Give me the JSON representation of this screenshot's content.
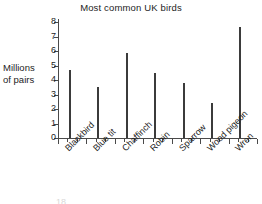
{
  "chart_data": {
    "type": "bar",
    "title": "Most common UK birds",
    "xlabel": "",
    "ylabel": "Millions of pairs",
    "ylabel_lines": [
      "Millions",
      "of pairs"
    ],
    "categories": [
      "Blackbird",
      "Blue tit",
      "Chaffinch",
      "Robin",
      "Sparrow",
      "Wood pigeon",
      "Wren"
    ],
    "values": [
      4.7,
      3.5,
      5.85,
      4.5,
      3.8,
      2.4,
      7.65
    ],
    "ylim": [
      0,
      8
    ],
    "yticks": [
      0,
      1,
      2,
      3,
      4,
      5,
      6,
      7,
      8
    ],
    "ytick_labels": [
      "0",
      "1",
      "2",
      "3",
      "4",
      "5",
      "6",
      "7",
      "8"
    ],
    "grid": false,
    "legend": false,
    "bar_color": "#3b3b3b",
    "axis_color": "#4a4a4a"
  },
  "artifact": {
    "page_number": "18"
  }
}
